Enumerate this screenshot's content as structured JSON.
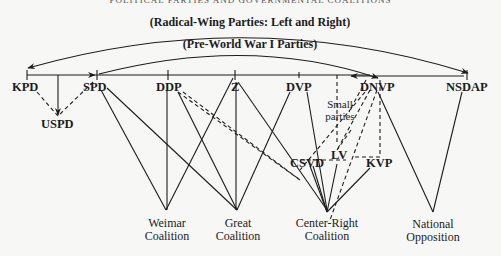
{
  "header": {
    "title": "POLITICAL PARTIES AND GOVERNMENTAL COALITIONS"
  },
  "arcs": {
    "radical": "(Radical-Wing Parties: Left and Right)",
    "prewar": "(Pre-World War I Parties)"
  },
  "parties": {
    "kpd": "KPD",
    "uspd": "USPD",
    "spd": "SPD",
    "ddp": "DDP",
    "z": "Z",
    "dvp": "DVP",
    "dnvp": "DNVP",
    "nsdap": "NSDAP",
    "small_line1": "Small",
    "small_line2": "parties",
    "lv": "LV",
    "csvd": "CSVD",
    "kvp": "KVP"
  },
  "coalitions": {
    "weimar_1": "Weimar",
    "weimar_2": "Coalition",
    "great_1": "Great",
    "great_2": "Coalition",
    "cr_1": "Center-Right",
    "cr_2": "Coalition",
    "nat_1": "National",
    "nat_2": "Opposition"
  }
}
